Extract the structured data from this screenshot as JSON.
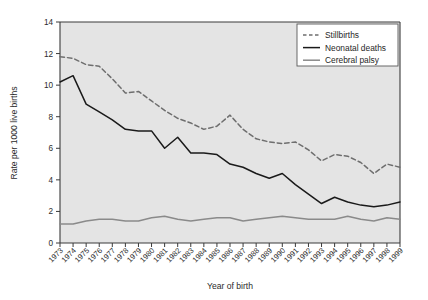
{
  "chart_data": {
    "type": "line",
    "title": "",
    "xlabel": "Year of birth",
    "ylabel": "Rate per 1000 live births",
    "xlim": [
      1973,
      1999
    ],
    "ylim": [
      0,
      14
    ],
    "ytick_step": 2,
    "yticks": [
      "0",
      "2",
      "4",
      "6",
      "8",
      "10",
      "12",
      "14"
    ],
    "grid": false,
    "legend_position": "top-right",
    "plot_background": "#e4e4e4",
    "categories": [
      "1973",
      "1974",
      "1975",
      "1976",
      "1977",
      "1978",
      "1979",
      "1980",
      "1981",
      "1982",
      "1983",
      "1984",
      "1985",
      "1986",
      "1987",
      "1988",
      "1989",
      "1990",
      "1991",
      "1992",
      "1993",
      "1994",
      "1995",
      "1996",
      "1997",
      "1998",
      "1999"
    ],
    "series": [
      {
        "name": "Stillbirths",
        "style": "dashed",
        "color": "#6e6e6e",
        "values": [
          11.8,
          11.7,
          11.3,
          11.2,
          10.4,
          9.5,
          9.6,
          9.0,
          8.4,
          7.9,
          7.6,
          7.2,
          7.4,
          8.1,
          7.2,
          6.6,
          6.4,
          6.3,
          6.4,
          5.9,
          5.2,
          5.6,
          5.5,
          5.1,
          4.4,
          5.0,
          4.8
        ]
      },
      {
        "name": "Neonatal deaths",
        "style": "solid",
        "color": "#1a1a1a",
        "values": [
          10.2,
          10.6,
          8.8,
          8.3,
          7.8,
          7.2,
          7.1,
          7.1,
          6.0,
          6.7,
          5.7,
          5.7,
          5.6,
          5.0,
          4.8,
          4.4,
          4.1,
          4.4,
          3.7,
          3.1,
          2.5,
          2.9,
          2.6,
          2.4,
          2.3,
          2.4,
          2.6
        ]
      },
      {
        "name": "Cerebral palsy",
        "style": "solid",
        "color": "#8a8a8a",
        "values": [
          1.2,
          1.2,
          1.4,
          1.5,
          1.5,
          1.4,
          1.4,
          1.6,
          1.7,
          1.5,
          1.4,
          1.5,
          1.6,
          1.6,
          1.4,
          1.5,
          1.6,
          1.7,
          1.6,
          1.5,
          1.5,
          1.5,
          1.7,
          1.5,
          1.4,
          1.6,
          1.5
        ]
      }
    ]
  },
  "legend": {
    "items": [
      {
        "label": "Stillbirths"
      },
      {
        "label": "Neonatal deaths"
      },
      {
        "label": "Cerebral palsy"
      }
    ]
  }
}
